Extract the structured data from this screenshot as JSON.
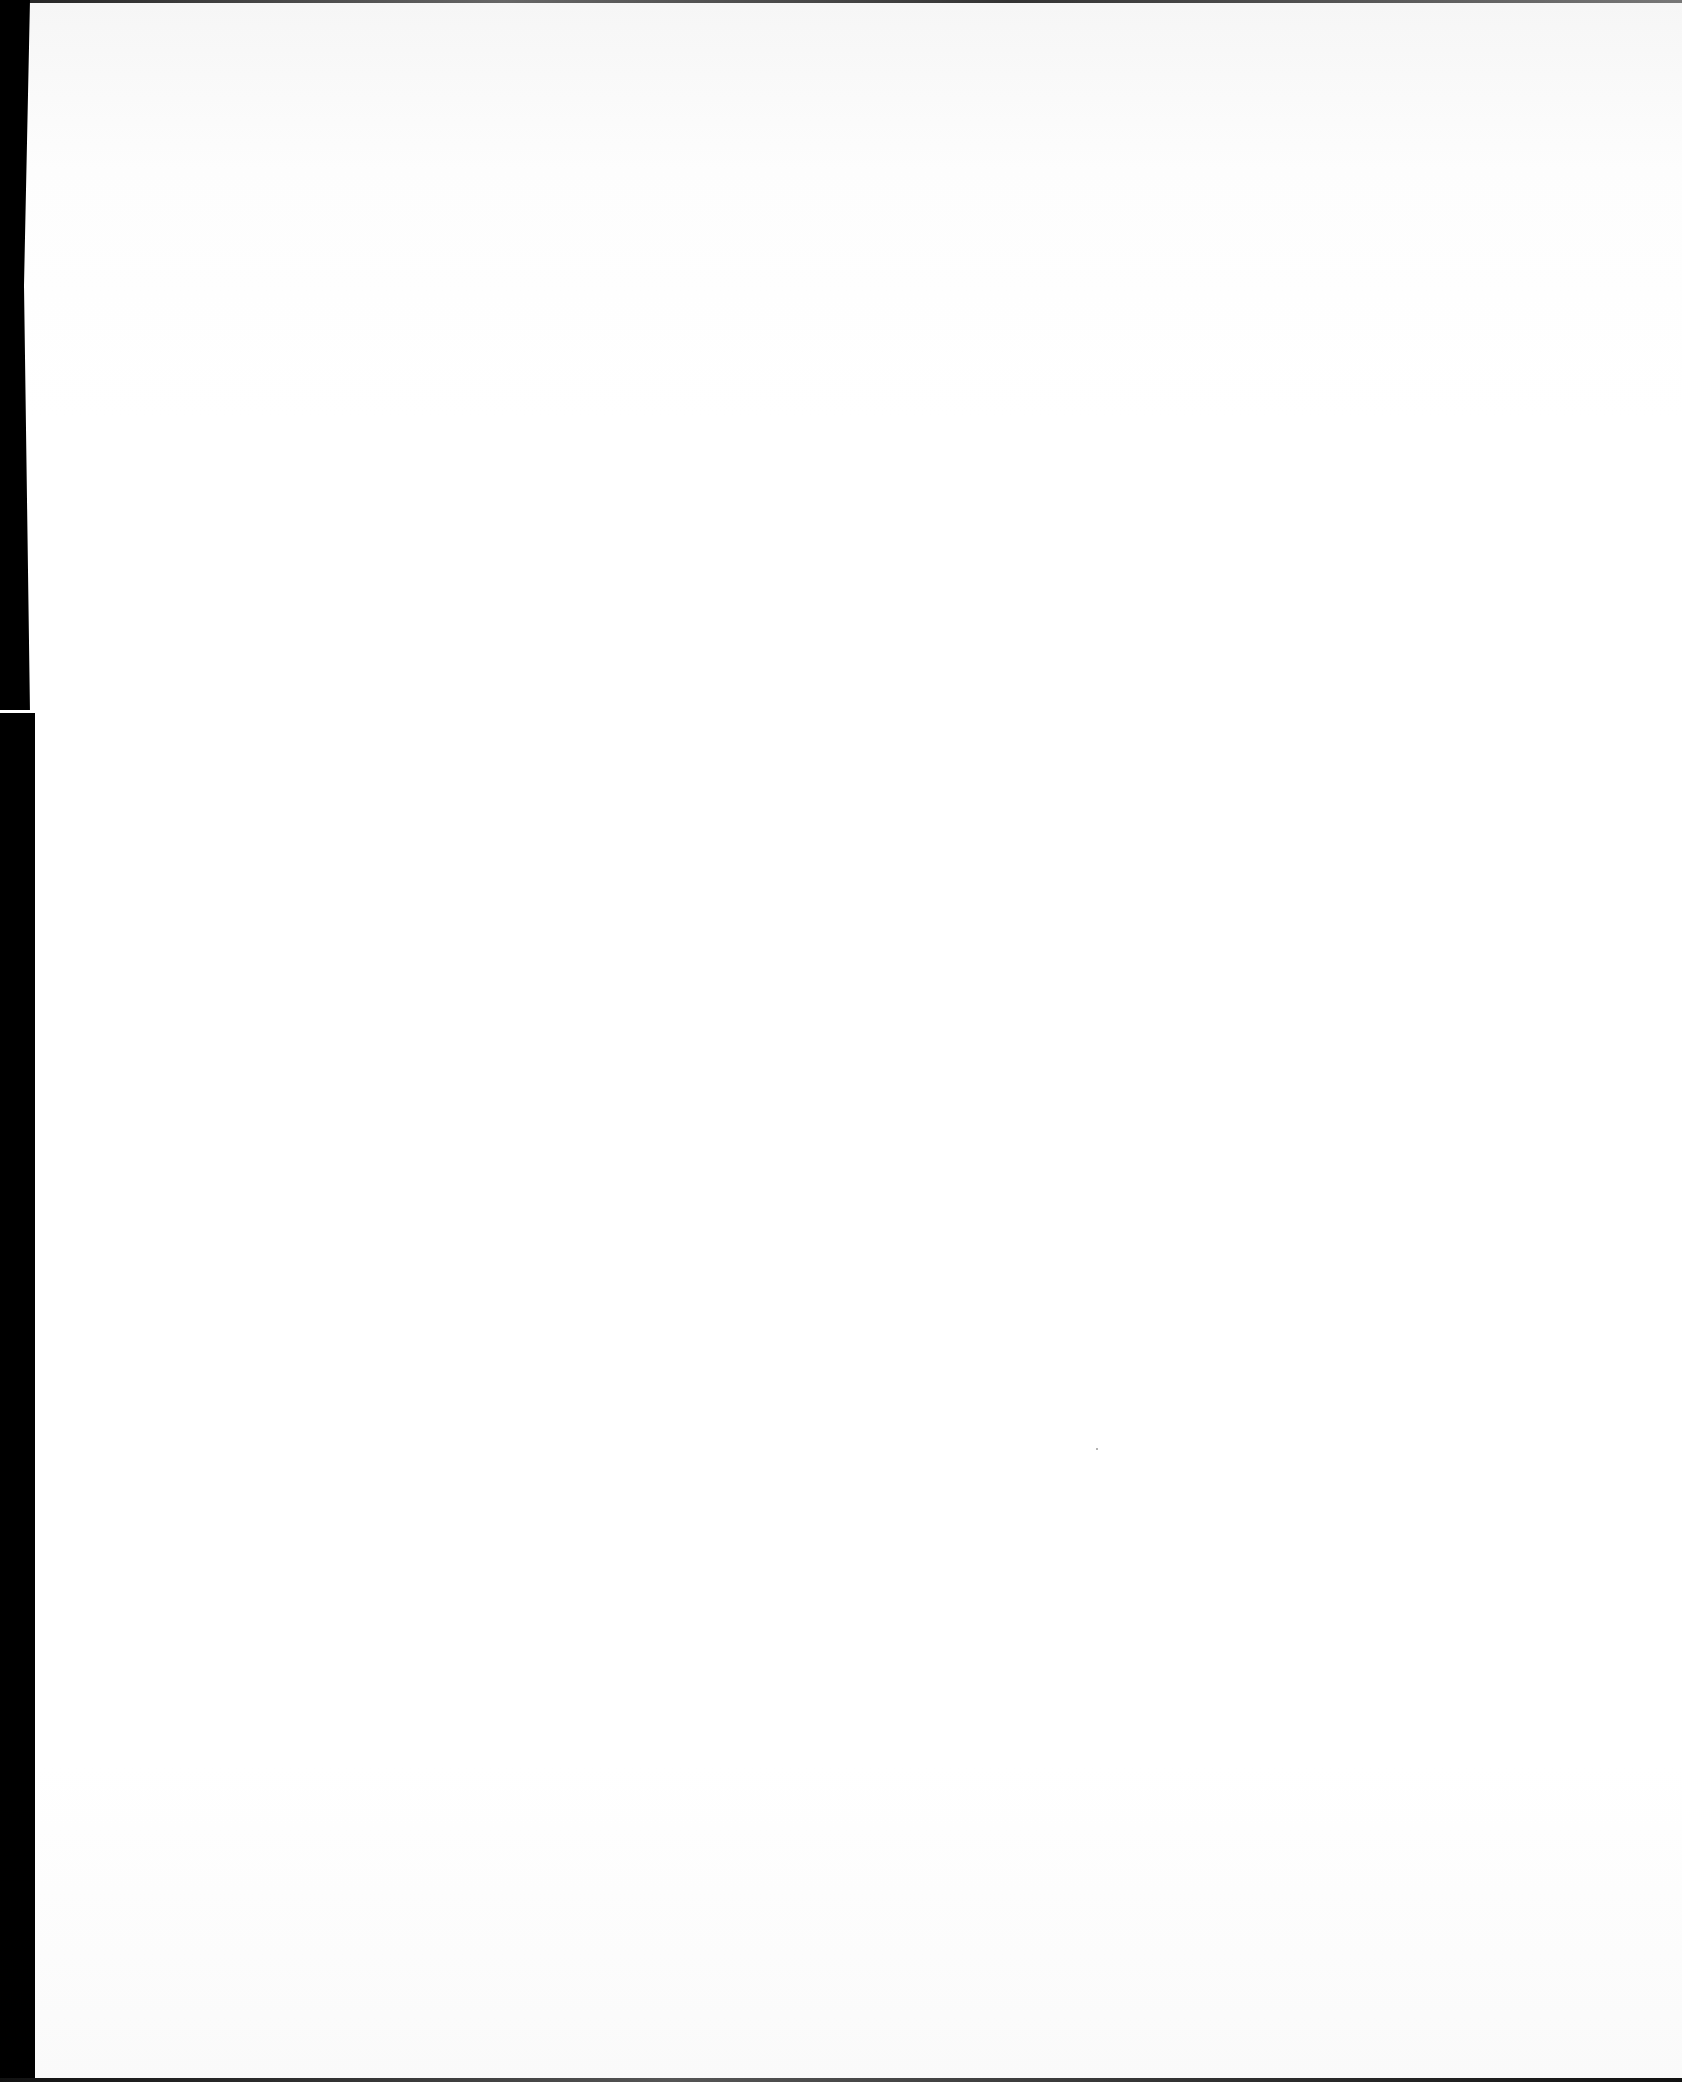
{
  "page": {
    "type": "blank scanned page",
    "text_content": "",
    "colors": {
      "paper": "#fefefe",
      "scan_border": "#000000"
    }
  }
}
